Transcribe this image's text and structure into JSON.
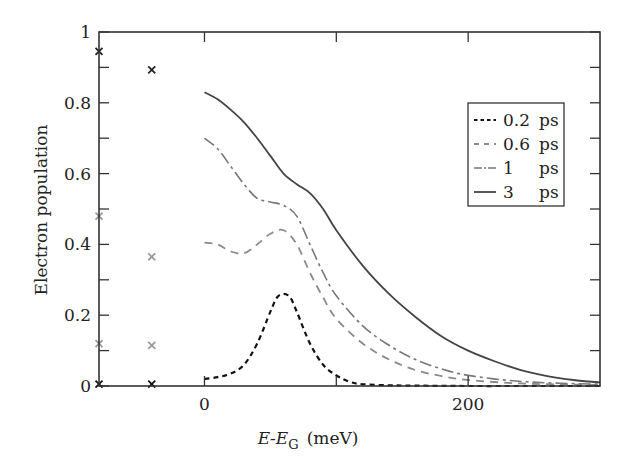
{
  "chart_data": {
    "type": "line",
    "title": "",
    "xlabel": "E-E_G (meV)",
    "xlabel_parts": {
      "e": "E",
      "dash": "-",
      "eg": "E",
      "sub": "G",
      "unit": "(meV)"
    },
    "ylabel": "Electron population",
    "xlim": [
      -80,
      300
    ],
    "ylim": [
      0,
      1
    ],
    "grid": false,
    "legend_position": "upper right (inset)",
    "x_ticks": [
      {
        "value": 0,
        "label": "0"
      },
      {
        "value": 100,
        "label": ""
      },
      {
        "value": 200,
        "label": "200"
      }
    ],
    "y_ticks": [
      {
        "value": 0,
        "label": "0"
      },
      {
        "value": 0.1,
        "label": ""
      },
      {
        "value": 0.2,
        "label": "0.2"
      },
      {
        "value": 0.3,
        "label": ""
      },
      {
        "value": 0.4,
        "label": "0.4"
      },
      {
        "value": 0.5,
        "label": ""
      },
      {
        "value": 0.6,
        "label": "0.6"
      },
      {
        "value": 0.7,
        "label": ""
      },
      {
        "value": 0.8,
        "label": "0.8"
      },
      {
        "value": 0.9,
        "label": ""
      },
      {
        "value": 1,
        "label": "1"
      }
    ],
    "series": [
      {
        "name": "0.2 ps",
        "label_value": "0.2",
        "label_unit": "ps",
        "style": "dotted-dash",
        "color": "#111111",
        "x": [
          0,
          10,
          20,
          30,
          40,
          50,
          55,
          60,
          65,
          70,
          80,
          90,
          100,
          110,
          120,
          140,
          160,
          200,
          250,
          300
        ],
        "y": [
          0.02,
          0.025,
          0.035,
          0.06,
          0.12,
          0.21,
          0.25,
          0.26,
          0.25,
          0.21,
          0.12,
          0.06,
          0.03,
          0.012,
          0.005,
          0.002,
          0.001,
          0.0,
          0.0,
          0.0
        ]
      },
      {
        "name": "0.6 ps",
        "label_value": "0.6",
        "label_unit": "ps",
        "style": "dashed",
        "color": "#8a8a8a",
        "x": [
          0,
          10,
          20,
          30,
          40,
          50,
          60,
          70,
          80,
          90,
          100,
          120,
          140,
          160,
          180,
          200,
          230,
          260,
          300
        ],
        "y": [
          0.405,
          0.4,
          0.38,
          0.375,
          0.4,
          0.43,
          0.44,
          0.4,
          0.32,
          0.25,
          0.19,
          0.12,
          0.075,
          0.045,
          0.028,
          0.017,
          0.009,
          0.005,
          0.003
        ]
      },
      {
        "name": "1 ps",
        "label_value": "1",
        "label_unit": "ps",
        "style": "dash-dot",
        "color": "#777777",
        "x": [
          0,
          10,
          20,
          30,
          40,
          50,
          60,
          70,
          80,
          90,
          100,
          120,
          140,
          160,
          180,
          200,
          230,
          260,
          300
        ],
        "y": [
          0.7,
          0.67,
          0.62,
          0.57,
          0.53,
          0.52,
          0.51,
          0.48,
          0.4,
          0.32,
          0.255,
          0.17,
          0.115,
          0.075,
          0.048,
          0.03,
          0.016,
          0.009,
          0.005
        ]
      },
      {
        "name": "3 ps",
        "label_value": "3",
        "label_unit": "ps",
        "style": "solid",
        "color": "#444444",
        "x": [
          0,
          10,
          20,
          30,
          40,
          50,
          60,
          70,
          80,
          90,
          100,
          120,
          140,
          160,
          180,
          200,
          220,
          240,
          260,
          280,
          300
        ],
        "y": [
          0.83,
          0.81,
          0.78,
          0.745,
          0.7,
          0.65,
          0.6,
          0.57,
          0.545,
          0.5,
          0.44,
          0.34,
          0.26,
          0.195,
          0.14,
          0.1,
          0.07,
          0.045,
          0.028,
          0.017,
          0.01
        ]
      }
    ],
    "markers": [
      {
        "x": -80,
        "y": 0.945,
        "color": "#222222"
      },
      {
        "x": -40,
        "y": 0.893,
        "color": "#222222"
      },
      {
        "x": -80,
        "y": 0.48,
        "color": "#999999"
      },
      {
        "x": -40,
        "y": 0.365,
        "color": "#999999"
      },
      {
        "x": -80,
        "y": 0.12,
        "color": "#999999"
      },
      {
        "x": -40,
        "y": 0.115,
        "color": "#999999"
      },
      {
        "x": -80,
        "y": 0.005,
        "color": "#111111"
      },
      {
        "x": -40,
        "y": 0.005,
        "color": "#111111"
      }
    ]
  },
  "layout": {
    "plot_left": 99,
    "plot_right": 600,
    "plot_top": 32,
    "plot_bottom": 386
  }
}
